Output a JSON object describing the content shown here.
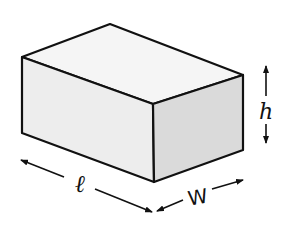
{
  "diagram": {
    "type": "rectangular-box-dimensions",
    "labels": {
      "length": "ℓ",
      "width": "W",
      "height": "h"
    },
    "colors": {
      "stroke": "#111111",
      "top_face": "#f5f5f5",
      "front_face": "#ededed",
      "side_face": "#dadada",
      "background": "#ffffff"
    }
  }
}
